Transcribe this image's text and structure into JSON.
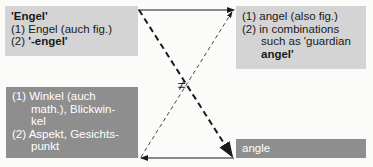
{
  "german_box": {
    "headword": "'Engel'",
    "items": [
      {
        "num": "(1)",
        "text": "Engel (auch fig.)"
      },
      {
        "num": "(2)",
        "text": "'-engel'"
      }
    ]
  },
  "english_box": {
    "items": [
      {
        "num": "(1)",
        "text": "angel (also fig.)"
      },
      {
        "num": "(2)",
        "lines": [
          "in combinations",
          "such as 'guardian",
          "angel'"
        ]
      }
    ]
  },
  "german_false_box": {
    "items": [
      {
        "num": "(1)",
        "lines": [
          "Winkel (auch",
          "math.), Blickwin-",
          "kel"
        ]
      },
      {
        "num": "(2)",
        "lines": [
          "Aspekt, Gesichts-",
          "punkt"
        ]
      }
    ]
  },
  "english_false_box": {
    "text": "angle"
  },
  "not_equal_symbol": "≠",
  "colors": {
    "light_box": "#d4d4d4",
    "dark_box": "#8e8e8e",
    "arrow": "#1a1a1a",
    "background": "#fbfbfa"
  }
}
